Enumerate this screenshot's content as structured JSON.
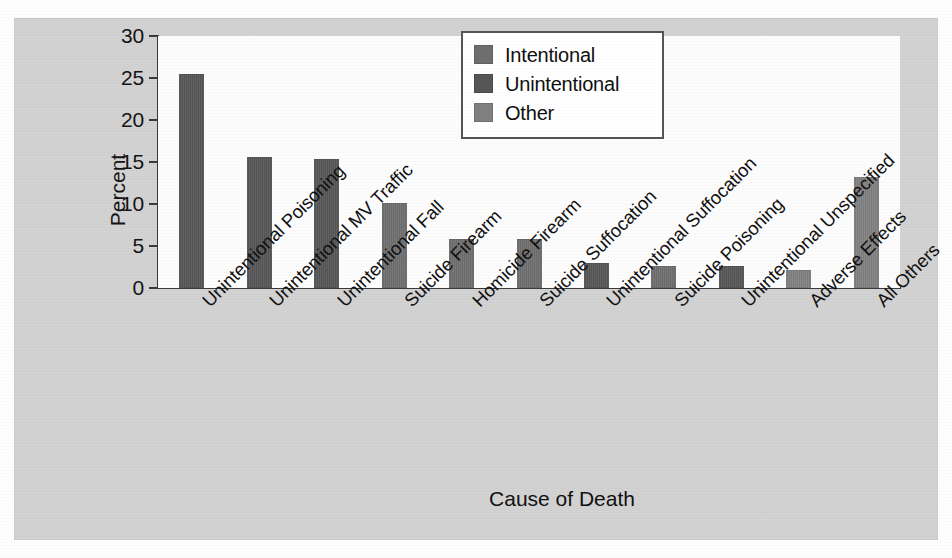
{
  "chart_data": {
    "type": "bar",
    "title": "",
    "xlabel": "Cause of Death",
    "ylabel": "Percent",
    "ylim": [
      0,
      30
    ],
    "yticks": [
      "0",
      "5",
      "10",
      "15",
      "20",
      "25",
      "30"
    ],
    "grid": false,
    "legend_position": "top-center-right",
    "categories": [
      "Unintentional Poisoning",
      "Unintentional MV Traffic",
      "Unintentional Fall",
      "Suicide Firearm",
      "Homicide Firearm",
      "Suicide Suffocation",
      "Unintentional Suffocation",
      "Suicide Poisoning",
      "Unintentional Unspecified",
      "Adverse Effects",
      "All Others"
    ],
    "values": [
      25.5,
      15.6,
      15.3,
      10.1,
      5.8,
      5.8,
      3.0,
      2.6,
      2.6,
      2.1,
      13.2
    ],
    "point_categories": [
      "Unintentional",
      "Unintentional",
      "Unintentional",
      "Intentional",
      "Intentional",
      "Intentional",
      "Unintentional",
      "Intentional",
      "Unintentional",
      "Other",
      "Other"
    ],
    "series": [
      {
        "name": "Intentional",
        "color": "#6e6e6e",
        "points": [
          {
            "category": "Suicide Firearm",
            "value": 10.1
          },
          {
            "category": "Homicide Firearm",
            "value": 5.8
          },
          {
            "category": "Suicide Suffocation",
            "value": 5.8
          },
          {
            "category": "Suicide Poisoning",
            "value": 2.6
          }
        ]
      },
      {
        "name": "Unintentional",
        "color": "#565656",
        "points": [
          {
            "category": "Unintentional Poisoning",
            "value": 25.5
          },
          {
            "category": "Unintentional MV Traffic",
            "value": 15.6
          },
          {
            "category": "Unintentional Fall",
            "value": 15.3
          },
          {
            "category": "Unintentional Suffocation",
            "value": 3.0
          },
          {
            "category": "Unintentional Unspecified",
            "value": 2.6
          }
        ]
      },
      {
        "name": "Other",
        "color": "#808080",
        "points": [
          {
            "category": "Adverse Effects",
            "value": 2.1
          },
          {
            "category": "All Others",
            "value": 13.2
          }
        ]
      }
    ]
  },
  "legend": {
    "entries": [
      {
        "label": "Intentional",
        "color": "#6e6e6e"
      },
      {
        "label": "Unintentional",
        "color": "#565656"
      },
      {
        "label": "Other",
        "color": "#808080"
      }
    ]
  },
  "axes": {
    "y_title": "Percent",
    "x_title": "Cause of Death",
    "y_ticks": [
      "30",
      "25",
      "20",
      "15",
      "10",
      "5",
      "0"
    ]
  },
  "colors": {
    "panel_background": "#d2d2d2",
    "plot_background": "#fcfcfc",
    "axis": "#3a3a3a",
    "text": "#111111"
  }
}
